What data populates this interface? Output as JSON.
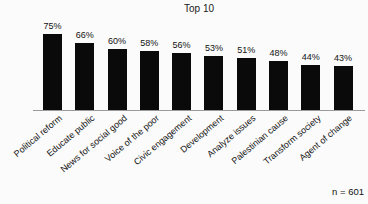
{
  "chart_data": {
    "type": "bar",
    "title": "Top 10",
    "categories": [
      "Political reform",
      "Educate public",
      "News for social good",
      "Voice of the poor",
      "Civic engagement",
      "Development",
      "Analyze issues",
      "Palestinian cause",
      "Transform society",
      "Agent of change"
    ],
    "values": [
      75,
      66,
      60,
      58,
      56,
      53,
      51,
      48,
      44,
      43
    ],
    "value_labels": [
      "75%",
      "66%",
      "60%",
      "58%",
      "56%",
      "53%",
      "51%",
      "48%",
      "44%",
      "43%"
    ],
    "note": "n = 601",
    "xlabel": "",
    "ylabel": "",
    "ylim": [
      0,
      100
    ],
    "grid": false,
    "legend": "none",
    "bar_color": "#0a0a0a",
    "axis_color": "#9a9a9a",
    "text_color": "#111111"
  }
}
